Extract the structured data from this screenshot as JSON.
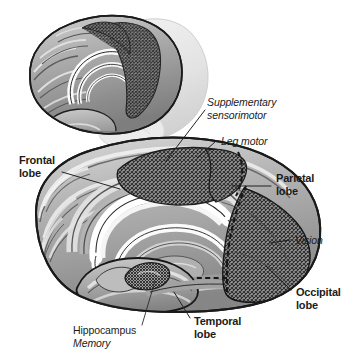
{
  "figure": {
    "background_color": "#ffffff",
    "line_color": "#1b1b1b"
  },
  "labels": {
    "supplementary_sensorimotor_line1": "Supplementary",
    "supplementary_sensorimotor_line2": "sensorimotor",
    "leg_motor": "Leg motor",
    "frontal_lobe_line1": "Frontal",
    "frontal_lobe_line2": "lobe",
    "parietal_lobe_line1": "Parietal",
    "parietal_lobe_line2": "lobe",
    "vision": "Vision",
    "occipital_lobe_line1": "Occipital",
    "occipital_lobe_line2": "lobe",
    "temporal_lobe_line1": "Temporal",
    "temporal_lobe_line2": "lobe",
    "hippocampus": "Hippocampus",
    "memory": "Memory"
  },
  "regions": {
    "supplementary_sensorimotor_fill": "crosshatch",
    "leg_motor_fill": "crosshatch",
    "vision_fill": "crosshatch",
    "hippocampus_fill": "crosshatch",
    "cortex_fill": "#a9a9a9",
    "corpus_callosum_fill": "#fdfdfd",
    "inset_ghost_fill": "#e8e8e8"
  },
  "views": {
    "inset_label": "three-quarter-view-brain",
    "main_label": "medial-view-brain"
  }
}
